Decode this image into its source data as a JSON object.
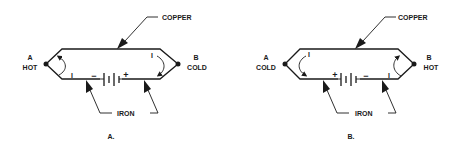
{
  "diagrams": [
    {
      "id": "A",
      "caption": "A.",
      "left_junction": {
        "letter": "A",
        "state": "HOT"
      },
      "right_junction": {
        "letter": "B",
        "state": "COLD"
      },
      "top_wire_label": "COPPER",
      "bottom_wire_label": "IRON",
      "battery_left_sign": "−",
      "battery_right_sign": "+",
      "current_label": "I",
      "current_direction": "clockwise"
    },
    {
      "id": "B",
      "caption": "B.",
      "left_junction": {
        "letter": "A",
        "state": "COLD"
      },
      "right_junction": {
        "letter": "B",
        "state": "HOT"
      },
      "top_wire_label": "COPPER",
      "bottom_wire_label": "IRON",
      "battery_left_sign": "+",
      "battery_right_sign": "−",
      "current_label": "I",
      "current_direction": "counterclockwise"
    }
  ]
}
